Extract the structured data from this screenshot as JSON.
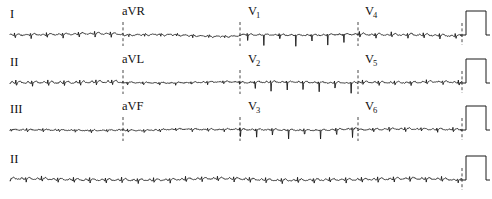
{
  "document": {
    "title": "12-Lead Electrocardiogram",
    "background_color": "#ffffff",
    "trace_color": "#1a1a1a",
    "divider_color": "#333333",
    "width": 492,
    "height": 199
  },
  "row_labels": [
    {
      "text": "I",
      "x": 10,
      "y": 18
    },
    {
      "text": "II",
      "x": 10,
      "y": 66
    },
    {
      "text": "III",
      "x": 10,
      "y": 113
    },
    {
      "text": "II",
      "x": 10,
      "y": 163
    }
  ],
  "column_labels": [
    {
      "text": "aVR",
      "sub": "",
      "x": 122,
      "y": 15
    },
    {
      "text": "aVL",
      "sub": "",
      "x": 122,
      "y": 63
    },
    {
      "text": "aVF",
      "sub": "",
      "x": 122,
      "y": 110
    },
    {
      "text": "V",
      "sub": "1",
      "x": 248,
      "y": 15
    },
    {
      "text": "V",
      "sub": "2",
      "x": 248,
      "y": 63
    },
    {
      "text": "V",
      "sub": "3",
      "x": 248,
      "y": 110
    },
    {
      "text": "V",
      "sub": "4",
      "x": 365,
      "y": 15
    },
    {
      "text": "V",
      "sub": "5",
      "x": 365,
      "y": 63
    },
    {
      "text": "V",
      "sub": "6",
      "x": 365,
      "y": 110
    }
  ],
  "chart_data": {
    "type": "line",
    "subtitle": "Standard 3x4 layout with lead II rhythm strip",
    "xlabel": "Time",
    "ylabel": "Amplitude (mV)",
    "grid": false,
    "legend": "none",
    "paper_speed": "25 mm/s",
    "calibration": "10 mm/mV",
    "layout": "3x4 plus rhythm strip",
    "rows": [
      {
        "row_index": 0,
        "baseline_y": 35,
        "leads": [
          "I",
          "aVR",
          "V1",
          "V4"
        ],
        "label": "I"
      },
      {
        "row_index": 1,
        "baseline_y": 83,
        "leads": [
          "II",
          "aVL",
          "V2",
          "V5"
        ],
        "label": "II"
      },
      {
        "row_index": 2,
        "baseline_y": 130,
        "leads": [
          "III",
          "aVF",
          "V3",
          "V6"
        ],
        "label": "III"
      },
      {
        "row_index": 3,
        "baseline_y": 180,
        "leads": [
          "II"
        ],
        "label": "II",
        "rhythm_strip": true
      }
    ],
    "column_boundaries_x": [
      28,
      123,
      240,
      358,
      462
    ],
    "calibration_pulse": {
      "x_start": 466,
      "x_end": 486,
      "height_px": 24,
      "description": "rectangular 1 mV calibration mark at right edge of every row"
    },
    "series": [
      {
        "name": "I",
        "row": 0,
        "column": 0,
        "amplitude_scale": 0.45,
        "morphology": "low-voltage complexes, small R waves, slightly wandering baseline",
        "beats": [
          {
            "t": 0.09,
            "r": 0.18,
            "q": -0.05,
            "s": -0.22,
            "p": 0.07,
            "tw": 0.1
          },
          {
            "t": 0.24,
            "r": 0.15,
            "q": -0.04,
            "s": -0.2,
            "p": 0.06,
            "tw": 0.09
          },
          {
            "t": 0.4,
            "r": 0.16,
            "q": -0.05,
            "s": -0.24,
            "p": 0.07,
            "tw": 0.1
          },
          {
            "t": 0.56,
            "r": 0.14,
            "q": -0.04,
            "s": -0.18,
            "p": 0.05,
            "tw": 0.08
          },
          {
            "t": 0.72,
            "r": 0.17,
            "q": -0.05,
            "s": -0.21,
            "p": 0.07,
            "tw": 0.09
          },
          {
            "t": 0.88,
            "r": 0.15,
            "q": -0.04,
            "s": -0.19,
            "p": 0.06,
            "tw": 0.09
          }
        ]
      },
      {
        "name": "aVR",
        "row": 0,
        "column": 1,
        "amplitude_scale": 0.4,
        "morphology": "predominantly negative P-QRS-T, low amplitude"
      },
      {
        "name": "V1",
        "row": 0,
        "column": 2,
        "amplitude_scale": 1.0,
        "morphology": "deep narrow QS / rS complexes, sharp negative deflections"
      },
      {
        "name": "V4",
        "row": 0,
        "column": 3,
        "amplitude_scale": 0.55,
        "morphology": "transition zone, modest R waves with small S"
      },
      {
        "name": "II",
        "row": 1,
        "column": 0,
        "amplitude_scale": 0.55,
        "morphology": "upright P waves, small R waves, low-voltage"
      },
      {
        "name": "aVL",
        "row": 1,
        "column": 1,
        "amplitude_scale": 0.4,
        "morphology": "flat, low amplitude with gentle baseline undulation"
      },
      {
        "name": "V2",
        "row": 1,
        "column": 2,
        "amplitude_scale": 0.95,
        "morphology": "deep S waves, rS pattern"
      },
      {
        "name": "V5",
        "row": 1,
        "column": 3,
        "amplitude_scale": 0.5,
        "morphology": "small R waves, low amplitude"
      },
      {
        "name": "III",
        "row": 2,
        "column": 0,
        "amplitude_scale": 0.35,
        "morphology": "very low amplitude, nearly isoelectric"
      },
      {
        "name": "aVF",
        "row": 2,
        "column": 1,
        "amplitude_scale": 0.35,
        "morphology": "low amplitude with a broad positive baseline hump"
      },
      {
        "name": "V3",
        "row": 2,
        "column": 2,
        "amplitude_scale": 0.85,
        "morphology": "deep S waves, rS pattern"
      },
      {
        "name": "V6",
        "row": 2,
        "column": 3,
        "amplitude_scale": 0.45,
        "morphology": "small R waves, low voltage"
      },
      {
        "name": "II-rhythm",
        "row": 3,
        "column": 0,
        "amplitude_scale": 0.5,
        "morphology": "continuous 10-second rhythm strip, regular rhythm, low voltage, noisy baseline"
      }
    ]
  }
}
